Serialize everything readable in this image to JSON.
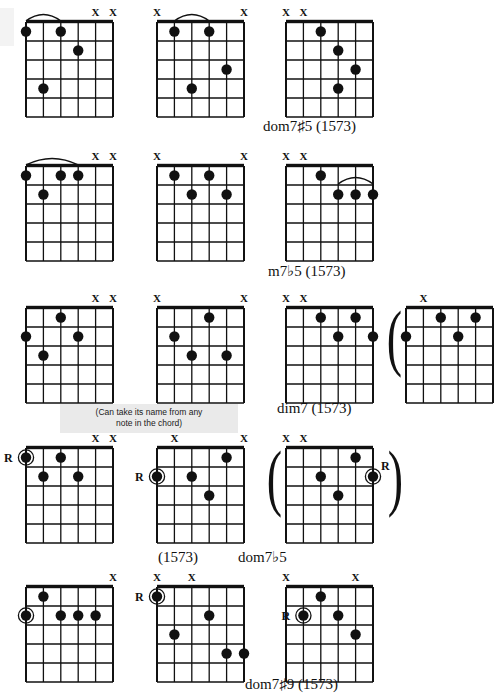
{
  "page": {
    "width": 465,
    "height": 696,
    "background": "#ffffff",
    "ink": "#111111"
  },
  "symbols": {
    "muted_string": "X",
    "root_marker": "R",
    "open_paren": "(",
    "close_paren": ")"
  },
  "note_box": {
    "line1": "(Can take its name from any",
    "line2": "note in the chord)",
    "background": "#eaeaea"
  },
  "captions": [
    {
      "id": "cap-dom7s5",
      "text": "dom7♯5 (1573)",
      "x": 263,
      "y": 118
    },
    {
      "id": "cap-m7b5",
      "text": "m7♭5 (1573)",
      "x": 268,
      "y": 263
    },
    {
      "id": "cap-dim7",
      "text": "dim7 (1573)",
      "x": 277,
      "y": 400
    },
    {
      "id": "cap-1573",
      "text": "(1573)",
      "x": 158,
      "y": 549
    },
    {
      "id": "cap-dom7b5",
      "text": "dom7♭5",
      "x": 238,
      "y": 549
    },
    {
      "id": "cap-dom7s9",
      "text": "dom7♯9 (1573)",
      "x": 245,
      "y": 676
    }
  ],
  "chart_data": {
    "type": "table",
    "grid_layout": {
      "rows": 5,
      "columns_per_row": [
        3,
        3,
        4,
        3,
        3
      ]
    },
    "diagrams": [
      {
        "id": "d1",
        "row": 1,
        "col": 1,
        "x": 26,
        "y": 22,
        "w": 87,
        "h": 95,
        "caption": "",
        "muted": [
          5,
          6
        ],
        "barre": {
          "from_string": 1,
          "to_string": 3,
          "fret": 1
        },
        "dots": [
          {
            "string": 1,
            "fret": 1,
            "root": false
          },
          {
            "string": 3,
            "fret": 1,
            "root": false
          },
          {
            "string": 4,
            "fret": 2,
            "root": false
          },
          {
            "string": 2,
            "fret": 4,
            "root": false
          }
        ]
      },
      {
        "id": "d2",
        "row": 1,
        "col": 2,
        "x": 157,
        "y": 22,
        "w": 87,
        "h": 95,
        "caption": "",
        "muted": [
          1,
          6
        ],
        "barre": {
          "from_string": 2,
          "to_string": 4,
          "fret": 1
        },
        "dots": [
          {
            "string": 2,
            "fret": 1,
            "root": false
          },
          {
            "string": 4,
            "fret": 1,
            "root": false
          },
          {
            "string": 5,
            "fret": 3,
            "root": false
          },
          {
            "string": 3,
            "fret": 4,
            "root": false
          }
        ]
      },
      {
        "id": "d3",
        "row": 1,
        "col": 3,
        "x": 286,
        "y": 22,
        "w": 87,
        "h": 95,
        "caption": "dom7♯5 (1573)",
        "muted": [
          1,
          2
        ],
        "barre": null,
        "dots": [
          {
            "string": 3,
            "fret": 1,
            "root": false
          },
          {
            "string": 4,
            "fret": 2,
            "root": false
          },
          {
            "string": 5,
            "fret": 3,
            "root": false
          },
          {
            "string": 4,
            "fret": 4,
            "root": false
          }
        ]
      },
      {
        "id": "d4",
        "row": 2,
        "col": 1,
        "x": 26,
        "y": 166,
        "w": 87,
        "h": 95,
        "caption": "",
        "muted": [
          5,
          6
        ],
        "barre": {
          "from_string": 1,
          "to_string": 4,
          "fret": 1
        },
        "dots": [
          {
            "string": 1,
            "fret": 1,
            "root": false
          },
          {
            "string": 3,
            "fret": 1,
            "root": false
          },
          {
            "string": 4,
            "fret": 1,
            "root": false
          },
          {
            "string": 2,
            "fret": 2,
            "root": false
          }
        ]
      },
      {
        "id": "d5",
        "row": 2,
        "col": 2,
        "x": 157,
        "y": 166,
        "w": 87,
        "h": 95,
        "caption": "",
        "muted": [
          1,
          6
        ],
        "barre": null,
        "dots": [
          {
            "string": 2,
            "fret": 1,
            "root": false
          },
          {
            "string": 4,
            "fret": 1,
            "root": false
          },
          {
            "string": 3,
            "fret": 2,
            "root": false
          },
          {
            "string": 5,
            "fret": 2,
            "root": false
          }
        ]
      },
      {
        "id": "d6",
        "row": 2,
        "col": 3,
        "x": 286,
        "y": 166,
        "w": 87,
        "h": 95,
        "caption": "m7♭5 (1573)",
        "muted": [
          1,
          2
        ],
        "barre": {
          "from_string": 4,
          "to_string": 6,
          "fret": 2
        },
        "dots": [
          {
            "string": 3,
            "fret": 1,
            "root": false
          },
          {
            "string": 4,
            "fret": 2,
            "root": false
          },
          {
            "string": 5,
            "fret": 2,
            "root": false
          },
          {
            "string": 6,
            "fret": 2,
            "root": false
          }
        ]
      },
      {
        "id": "d7",
        "row": 3,
        "col": 1,
        "x": 26,
        "y": 308,
        "w": 87,
        "h": 95,
        "caption": "",
        "muted": [
          5,
          6
        ],
        "barre": null,
        "dots": [
          {
            "string": 3,
            "fret": 1,
            "root": false
          },
          {
            "string": 1,
            "fret": 2,
            "root": false
          },
          {
            "string": 4,
            "fret": 2,
            "root": false
          },
          {
            "string": 2,
            "fret": 3,
            "root": false
          }
        ]
      },
      {
        "id": "d8",
        "row": 3,
        "col": 2,
        "x": 157,
        "y": 308,
        "w": 87,
        "h": 95,
        "caption": "",
        "muted": [
          1,
          6
        ],
        "barre": null,
        "dots": [
          {
            "string": 4,
            "fret": 1,
            "root": false
          },
          {
            "string": 2,
            "fret": 2,
            "root": false
          },
          {
            "string": 3,
            "fret": 3,
            "root": false
          },
          {
            "string": 5,
            "fret": 3,
            "root": false
          }
        ]
      },
      {
        "id": "d9",
        "row": 3,
        "col": 3,
        "x": 286,
        "y": 308,
        "w": 87,
        "h": 95,
        "caption": "dim7 (1573)",
        "muted": [
          1,
          2
        ],
        "barre": null,
        "dots": [
          {
            "string": 3,
            "fret": 1,
            "root": false
          },
          {
            "string": 5,
            "fret": 1,
            "root": false
          },
          {
            "string": 4,
            "fret": 2,
            "root": false
          },
          {
            "string": 6,
            "fret": 2,
            "root": false
          }
        ]
      },
      {
        "id": "d10",
        "row": 3,
        "col": 4,
        "x": 406,
        "y": 308,
        "w": 87,
        "h": 95,
        "caption": "",
        "clipped_right": true,
        "parens": {
          "left": true,
          "right": false
        },
        "muted": [
          2
        ],
        "barre": null,
        "dots": [
          {
            "string": 3,
            "fret": 1,
            "root": false
          },
          {
            "string": 5,
            "fret": 1,
            "root": false
          },
          {
            "string": 1,
            "fret": 2,
            "root": false
          },
          {
            "string": 4,
            "fret": 2,
            "root": false
          }
        ]
      },
      {
        "id": "d11",
        "row": 4,
        "col": 1,
        "x": 26,
        "y": 448,
        "w": 87,
        "h": 95,
        "caption": "",
        "muted": [
          5,
          6
        ],
        "root_label": {
          "string": 1,
          "fret": 1,
          "side": "left"
        },
        "barre": null,
        "dots": [
          {
            "string": 1,
            "fret": 1,
            "root": true
          },
          {
            "string": 3,
            "fret": 1,
            "root": false
          },
          {
            "string": 2,
            "fret": 2,
            "root": false
          },
          {
            "string": 4,
            "fret": 2,
            "root": false
          }
        ]
      },
      {
        "id": "d12",
        "row": 4,
        "col": 2,
        "x": 157,
        "y": 448,
        "w": 87,
        "h": 95,
        "caption": "(1573)",
        "muted": [
          2,
          6
        ],
        "root_label": {
          "string": 1,
          "fret": 2,
          "side": "left"
        },
        "barre": null,
        "dots": [
          {
            "string": 5,
            "fret": 1,
            "root": false
          },
          {
            "string": 1,
            "fret": 2,
            "root": true
          },
          {
            "string": 3,
            "fret": 2,
            "root": false
          },
          {
            "string": 4,
            "fret": 3,
            "root": false
          }
        ]
      },
      {
        "id": "d13",
        "row": 4,
        "col": 3,
        "x": 286,
        "y": 448,
        "w": 87,
        "h": 95,
        "caption": "dom7♭5",
        "parens": {
          "left": true,
          "right": true
        },
        "muted": [
          1,
          2
        ],
        "root_label": {
          "string": 6,
          "fret": 2,
          "side": "right"
        },
        "barre": null,
        "dots": [
          {
            "string": 5,
            "fret": 1,
            "root": false
          },
          {
            "string": 3,
            "fret": 2,
            "root": false
          },
          {
            "string": 6,
            "fret": 2,
            "root": true
          },
          {
            "string": 4,
            "fret": 3,
            "root": false
          }
        ]
      },
      {
        "id": "d14",
        "row": 5,
        "col": 1,
        "x": 26,
        "y": 587,
        "w": 87,
        "h": 95,
        "caption": "",
        "muted": [
          6
        ],
        "barre": null,
        "dots": [
          {
            "string": 2,
            "fret": 1,
            "root": false
          },
          {
            "string": 1,
            "fret": 2,
            "root": true
          },
          {
            "string": 3,
            "fret": 2,
            "root": false
          },
          {
            "string": 4,
            "fret": 2,
            "root": false
          },
          {
            "string": 5,
            "fret": 2,
            "root": false
          }
        ]
      },
      {
        "id": "d15",
        "row": 5,
        "col": 2,
        "x": 157,
        "y": 587,
        "w": 87,
        "h": 95,
        "caption": "",
        "muted": [
          1,
          3
        ],
        "root_label": {
          "string": 1,
          "fret": 1,
          "side": "left"
        },
        "barre": null,
        "dots": [
          {
            "string": 1,
            "fret": 1,
            "root": true
          },
          {
            "string": 4,
            "fret": 2,
            "root": false
          },
          {
            "string": 2,
            "fret": 3,
            "root": false
          },
          {
            "string": 5,
            "fret": 4,
            "root": false
          },
          {
            "string": 6,
            "fret": 4,
            "root": false
          }
        ]
      },
      {
        "id": "d16",
        "row": 5,
        "col": 3,
        "x": 286,
        "y": 587,
        "w": 87,
        "h": 95,
        "caption": "dom7♯9 (1573)",
        "muted": [
          1,
          5
        ],
        "root_label": {
          "string": 2,
          "fret": 2,
          "side": "left"
        },
        "barre": null,
        "dots": [
          {
            "string": 3,
            "fret": 1,
            "root": false
          },
          {
            "string": 2,
            "fret": 2,
            "root": true
          },
          {
            "string": 4,
            "fret": 2,
            "root": false
          },
          {
            "string": 5,
            "fret": 3,
            "root": false
          }
        ]
      }
    ]
  }
}
